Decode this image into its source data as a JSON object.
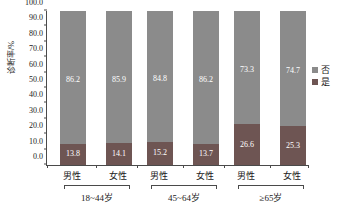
{
  "chart_data": {
    "type": "bar",
    "subtype": "stacked-100-percent",
    "title": "",
    "xlabel": "",
    "ylabel": "诊断率/%",
    "ylim": [
      0,
      100
    ],
    "ytick_labels": [
      "0.0",
      "10.0",
      "20.0",
      "30.0",
      "40.0",
      "50.0",
      "60.0",
      "70.0",
      "80.0",
      "90.0",
      "100.0"
    ],
    "ytick_values": [
      0,
      10,
      20,
      30,
      40,
      50,
      60,
      70,
      80,
      90,
      100
    ],
    "grid": false,
    "legend_position": "right",
    "categories": [
      "男性",
      "女性",
      "男性",
      "女性",
      "男性",
      "女性"
    ],
    "groups": [
      {
        "label": "18~44岁",
        "categories": [
          "男性",
          "女性"
        ]
      },
      {
        "label": "45~64岁",
        "categories": [
          "男性",
          "女性"
        ]
      },
      {
        "label": "≥65岁",
        "categories": [
          "男性",
          "女性"
        ]
      }
    ],
    "series": [
      {
        "name": "否",
        "color": "#8b8b8b",
        "values": [
          86.2,
          85.9,
          84.8,
          86.2,
          73.3,
          74.7
        ],
        "labels": [
          "86.2",
          "85.9",
          "84.8",
          "86.2",
          "73.3",
          "74.7"
        ]
      },
      {
        "name": "是",
        "color": "#6e5553",
        "values": [
          13.8,
          14.1,
          15.2,
          13.7,
          26.6,
          25.3
        ],
        "labels": [
          "13.8",
          "14.1",
          "15.2",
          "13.7",
          "26.6",
          "25.3"
        ]
      }
    ]
  },
  "legend": {
    "items": [
      {
        "label": "否",
        "color": "#8b8b8b"
      },
      {
        "label": "是",
        "color": "#6e5553"
      }
    ]
  }
}
